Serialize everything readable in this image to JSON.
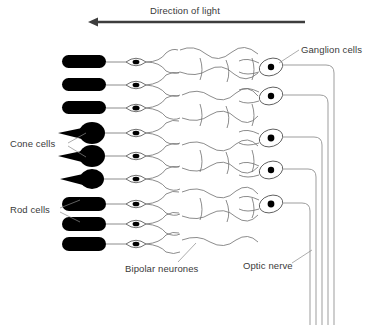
{
  "diagram": {
    "direction_label": "Direction of light",
    "arrow": {
      "name": "direction-of-light-arrow",
      "points": "left",
      "x_start": 305,
      "x_end": 88,
      "y": 22
    },
    "labels": [
      {
        "id": "ganglion",
        "text": "Ganglion cells",
        "x": 301,
        "y": 51
      },
      {
        "id": "cone",
        "text": "Cone cells",
        "x": 10,
        "y": 145
      },
      {
        "id": "rod",
        "text": "Rod cells",
        "x": 10,
        "y": 211
      },
      {
        "id": "bipolar",
        "text": "Bipolar neurones",
        "x": 125,
        "y": 270
      },
      {
        "id": "optic",
        "text": "Optic nerve",
        "x": 243,
        "y": 267
      }
    ],
    "photoreceptors": [
      {
        "type": "rod",
        "y": 62
      },
      {
        "type": "rod",
        "y": 85
      },
      {
        "type": "rod",
        "y": 108
      },
      {
        "type": "cone",
        "y": 133
      },
      {
        "type": "cone",
        "y": 156
      },
      {
        "type": "cone",
        "y": 179
      },
      {
        "type": "rod",
        "y": 204
      },
      {
        "type": "rod",
        "y": 224
      },
      {
        "type": "rod",
        "y": 244
      }
    ],
    "bipolar_neurons_y": [
      62,
      85,
      108,
      133,
      156,
      179,
      204,
      224,
      244
    ],
    "ganglion_cells_y": [
      67,
      96,
      138,
      170,
      204
    ],
    "optic_nerve_fiber_count": 5,
    "colors": {
      "text": "#3a3a3a",
      "outline": "#6e6e6e",
      "cell_fill": "#ffffff",
      "nucleus": "#000000",
      "photoreceptor": "#000000",
      "arrow": "#3d3d3d",
      "background": "#ffffff"
    }
  }
}
